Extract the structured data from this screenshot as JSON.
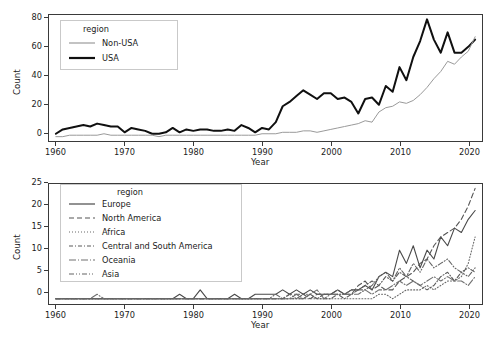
{
  "chart_data": [
    {
      "id": "top-panel",
      "type": "line",
      "title": "",
      "xlabel": "Year",
      "ylabel": "Count",
      "xlim": [
        1959,
        2022
      ],
      "ylim": [
        -3,
        84
      ],
      "xticks": [
        1960,
        1970,
        1980,
        1990,
        2000,
        2010,
        2020
      ],
      "yticks": [
        0,
        20,
        40,
        60,
        80
      ],
      "grid": false,
      "legend": {
        "title": "region",
        "position": "upper-left"
      },
      "x": [
        1960,
        1961,
        1962,
        1963,
        1964,
        1965,
        1966,
        1967,
        1968,
        1969,
        1970,
        1971,
        1972,
        1973,
        1974,
        1975,
        1976,
        1977,
        1978,
        1979,
        1980,
        1981,
        1982,
        1983,
        1984,
        1985,
        1986,
        1987,
        1988,
        1989,
        1990,
        1991,
        1992,
        1993,
        1994,
        1995,
        1996,
        1997,
        1998,
        1999,
        2000,
        2001,
        2002,
        2003,
        2004,
        2005,
        2006,
        2007,
        2008,
        2009,
        2010,
        2011,
        2012,
        2013,
        2014,
        2015,
        2016,
        2017,
        2018,
        2019,
        2020,
        2021
      ],
      "series": [
        {
          "name": "USA",
          "style": "solid",
          "color": "#101010",
          "width": 2.0,
          "values": [
            2,
            5,
            6,
            7,
            8,
            7,
            9,
            8,
            7,
            7,
            3,
            6,
            5,
            4,
            2,
            2,
            3,
            6,
            3,
            5,
            4,
            5,
            5,
            4,
            4,
            5,
            4,
            8,
            6,
            3,
            6,
            5,
            10,
            21,
            24,
            28,
            32,
            29,
            26,
            30,
            30,
            26,
            27,
            24,
            16,
            26,
            27,
            22,
            35,
            31,
            48,
            39,
            55,
            66,
            81,
            67,
            58,
            72,
            58,
            58,
            62,
            67
          ]
        },
        {
          "name": "Non-USA",
          "style": "solid",
          "color": "#9a9a9a",
          "width": 1.0,
          "values": [
            0,
            0,
            1,
            1,
            1,
            1,
            1,
            2,
            1,
            1,
            1,
            1,
            1,
            1,
            1,
            0,
            1,
            1,
            1,
            1,
            1,
            1,
            1,
            1,
            1,
            1,
            1,
            1,
            1,
            1,
            2,
            2,
            2,
            3,
            3,
            3,
            4,
            4,
            3,
            4,
            5,
            6,
            7,
            8,
            9,
            11,
            10,
            17,
            20,
            21,
            24,
            23,
            25,
            29,
            34,
            40,
            45,
            52,
            50,
            55,
            59,
            69
          ]
        }
      ]
    },
    {
      "id": "bottom-panel",
      "type": "line",
      "title": "",
      "xlabel": "Year",
      "ylabel": "Count",
      "xlim": [
        1959,
        2022
      ],
      "ylim": [
        -1.2,
        26
      ],
      "xticks": [
        1960,
        1970,
        1980,
        1990,
        2000,
        2010,
        2020
      ],
      "yticks": [
        0,
        5,
        10,
        15,
        20,
        25
      ],
      "grid": false,
      "legend": {
        "title": "region",
        "position": "upper-left"
      },
      "x": [
        1960,
        1961,
        1962,
        1963,
        1964,
        1965,
        1966,
        1967,
        1968,
        1969,
        1970,
        1971,
        1972,
        1973,
        1974,
        1975,
        1976,
        1977,
        1978,
        1979,
        1980,
        1981,
        1982,
        1983,
        1984,
        1985,
        1986,
        1987,
        1988,
        1989,
        1990,
        1991,
        1992,
        1993,
        1994,
        1995,
        1996,
        1997,
        1998,
        1999,
        2000,
        2001,
        2002,
        2003,
        2004,
        2005,
        2006,
        2007,
        2008,
        2009,
        2010,
        2011,
        2012,
        2013,
        2014,
        2015,
        2016,
        2017,
        2018,
        2019,
        2020,
        2021
      ],
      "series": [
        {
          "name": "Europe",
          "style": "solid",
          "color": "#4a4a4a",
          "width": 1.1,
          "values": [
            0,
            0,
            0,
            0,
            0,
            0,
            0,
            0,
            0,
            0,
            0,
            0,
            0,
            0,
            0,
            0,
            0,
            0,
            1,
            0,
            0,
            2,
            0,
            0,
            0,
            0,
            1,
            0,
            0,
            1,
            1,
            1,
            1,
            2,
            1,
            2,
            1,
            2,
            1,
            1,
            1,
            2,
            1,
            2,
            2,
            3,
            2,
            5,
            6,
            5,
            11,
            8,
            12,
            7,
            11,
            9,
            14,
            12,
            16,
            15,
            18,
            20
          ]
        },
        {
          "name": "North America",
          "style": "dashed",
          "color": "#555555",
          "width": 1.1,
          "values": [
            0,
            0,
            0,
            0,
            0,
            0,
            0,
            0,
            0,
            0,
            0,
            0,
            0,
            0,
            0,
            0,
            0,
            0,
            0,
            0,
            0,
            0,
            0,
            0,
            0,
            0,
            0,
            0,
            0,
            0,
            0,
            0,
            0,
            0,
            1,
            1,
            1,
            0,
            1,
            1,
            1,
            2,
            1,
            1,
            3,
            4,
            2,
            3,
            2,
            2,
            4,
            5,
            6,
            8,
            9,
            12,
            14,
            15,
            16,
            18,
            21,
            25
          ]
        },
        {
          "name": "Africa",
          "style": "dotted",
          "color": "#6a6a6a",
          "width": 1.1,
          "values": [
            0,
            0,
            0,
            0,
            0,
            0,
            0,
            0,
            0,
            0,
            0,
            0,
            0,
            0,
            0,
            0,
            0,
            0,
            0,
            0,
            0,
            0,
            0,
            0,
            0,
            0,
            0,
            0,
            0,
            0,
            0,
            0,
            0,
            0,
            0,
            0,
            0,
            0,
            0,
            0,
            0,
            0,
            0,
            0,
            0,
            0,
            0,
            1,
            1,
            0,
            1,
            2,
            2,
            2,
            3,
            2,
            3,
            4,
            4,
            5,
            8,
            14
          ]
        },
        {
          "name": "Central and South America",
          "style": "dashdot",
          "color": "#5a5a5a",
          "width": 1.1,
          "values": [
            0,
            0,
            0,
            0,
            0,
            0,
            0,
            0,
            0,
            0,
            0,
            0,
            0,
            0,
            0,
            0,
            0,
            0,
            0,
            0,
            0,
            0,
            0,
            0,
            0,
            0,
            0,
            0,
            0,
            0,
            0,
            0,
            0,
            0,
            0,
            0,
            0,
            1,
            0,
            0,
            0,
            1,
            0,
            1,
            2,
            3,
            4,
            3,
            5,
            4,
            6,
            5,
            4,
            3,
            2,
            3,
            5,
            6,
            4,
            6,
            7,
            6
          ]
        },
        {
          "name": "Oceania",
          "style": "longdashdot",
          "color": "#707070",
          "width": 1.1,
          "values": [
            0,
            0,
            0,
            0,
            0,
            0,
            1,
            0,
            0,
            0,
            0,
            0,
            0,
            0,
            0,
            0,
            0,
            0,
            0,
            0,
            0,
            0,
            0,
            0,
            0,
            0,
            0,
            0,
            0,
            0,
            0,
            0,
            0,
            0,
            0,
            1,
            0,
            1,
            2,
            0,
            1,
            1,
            1,
            1,
            1,
            2,
            1,
            2,
            2,
            3,
            4,
            3,
            4,
            3,
            4,
            5,
            4,
            5,
            4,
            4,
            3,
            5
          ]
        },
        {
          "name": "Asia",
          "style": "dashdotdot",
          "color": "#646464",
          "width": 1.1,
          "values": [
            0,
            0,
            0,
            0,
            0,
            0,
            0,
            0,
            0,
            0,
            0,
            0,
            0,
            0,
            0,
            0,
            0,
            0,
            0,
            0,
            0,
            0,
            0,
            0,
            0,
            0,
            0,
            0,
            0,
            0,
            0,
            0,
            1,
            0,
            1,
            0,
            1,
            1,
            0,
            1,
            1,
            1,
            1,
            2,
            2,
            2,
            3,
            5,
            6,
            4,
            7,
            5,
            8,
            6,
            9,
            7,
            8,
            9,
            7,
            6,
            5,
            7
          ]
        }
      ]
    }
  ],
  "top": {
    "ylabel": "Count",
    "xlabel": "Year",
    "yticks": [
      "80",
      "60",
      "40",
      "20",
      "0"
    ],
    "xticks": [
      "1960",
      "1970",
      "1980",
      "1990",
      "2000",
      "2010",
      "2020"
    ],
    "legend": {
      "title": "region",
      "items": [
        {
          "label": "Non-USA"
        },
        {
          "label": "USA"
        }
      ]
    }
  },
  "bottom": {
    "ylabel": "Count",
    "xlabel": "Year",
    "yticks": [
      "25",
      "20",
      "15",
      "10",
      "5",
      "0"
    ],
    "xticks": [
      "1960",
      "1970",
      "1980",
      "1990",
      "2000",
      "2010",
      "2020"
    ],
    "legend": {
      "title": "region",
      "items": [
        {
          "label": "Europe"
        },
        {
          "label": "North America"
        },
        {
          "label": "Africa"
        },
        {
          "label": "Central and South America"
        },
        {
          "label": "Oceania"
        },
        {
          "label": "Asia"
        }
      ]
    }
  }
}
